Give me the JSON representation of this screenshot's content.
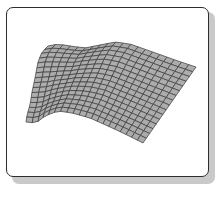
{
  "chart_data": {
    "type": "surface",
    "title": "",
    "xlabel": "",
    "ylabel": "",
    "zlabel": "",
    "grid": true,
    "legend": null,
    "mesh": {
      "u_cells": 20,
      "v_cells": 16
    },
    "colors": {
      "fill": "#a9a9a9",
      "grid_line": "#3a3a3a",
      "frame": "#2e2e2e",
      "shadow": "#c9c9c9"
    },
    "outline": {
      "top": [
        [
          48,
          46
        ],
        [
          58,
          44
        ],
        [
          70,
          46
        ],
        [
          85,
          48
        ],
        [
          100,
          45
        ],
        [
          115,
          42
        ],
        [
          130,
          44
        ],
        [
          150,
          51
        ],
        [
          175,
          60
        ],
        [
          196,
          67
        ]
      ],
      "bottom": [
        [
          26,
          122
        ],
        [
          36,
          123
        ],
        [
          45,
          116
        ],
        [
          58,
          111
        ],
        [
          72,
          113
        ],
        [
          90,
          118
        ],
        [
          110,
          127
        ],
        [
          125,
          134
        ],
        [
          143,
          143
        ]
      ],
      "left": [
        [
          48,
          46
        ],
        [
          42,
          52
        ],
        [
          38,
          62
        ],
        [
          35,
          78
        ],
        [
          32,
          92
        ],
        [
          30,
          105
        ],
        [
          27,
          115
        ],
        [
          26,
          122
        ]
      ],
      "right": [
        [
          196,
          67
        ],
        [
          143,
          143
        ]
      ]
    }
  }
}
